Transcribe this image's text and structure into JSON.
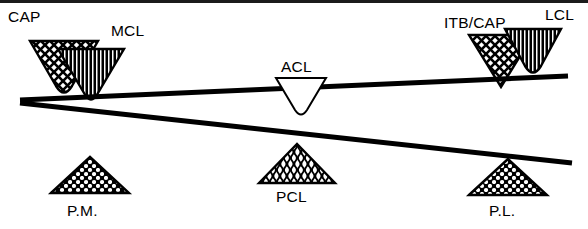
{
  "figure": {
    "background_color": "#ffffff",
    "ink_color": "#000000",
    "width": 588,
    "height": 229
  },
  "labels": {
    "cap": "CAP",
    "mcl": "MCL",
    "acl": "ACL",
    "itb_cap": "ITB/CAP",
    "lcl": "LCL",
    "pm": "P.M.",
    "pcl": "PCL",
    "pl": "P.L."
  },
  "lines": [
    {
      "name": "upper-line",
      "from_x": 20,
      "from_y": 100,
      "to_x": 568,
      "to_y": 76,
      "thickness": 5
    },
    {
      "name": "lower-line",
      "from_x": 20,
      "from_y": 103,
      "to_x": 572,
      "to_y": 163,
      "thickness": 5
    }
  ],
  "markers": [
    {
      "name": "cap",
      "label": "CAP",
      "orientation": "inverted",
      "pattern": "crosshatch",
      "fill": "#ffffff",
      "rounded_apex": true,
      "x": 30,
      "y": 41,
      "width": 68,
      "height": 58
    },
    {
      "name": "mcl",
      "label": "MCL",
      "orientation": "inverted",
      "pattern": "vertical-lines",
      "fill": "#000000",
      "rounded_apex": true,
      "x": 58,
      "y": 49,
      "width": 66,
      "height": 54
    },
    {
      "name": "acl",
      "label": "ACL",
      "orientation": "inverted",
      "pattern": "none",
      "fill": "#ffffff",
      "rounded_apex": true,
      "x": 276,
      "y": 78,
      "width": 50,
      "height": 36
    },
    {
      "name": "itb-cap",
      "label": "ITB/CAP",
      "orientation": "inverted",
      "pattern": "crosshatch",
      "fill": "#ffffff",
      "rounded_apex": false,
      "x": 469,
      "y": 35,
      "width": 64,
      "height": 52
    },
    {
      "name": "lcl",
      "label": "LCL",
      "orientation": "inverted",
      "pattern": "vertical-lines",
      "fill": "#000000",
      "rounded_apex": true,
      "x": 505,
      "y": 29,
      "width": 56,
      "height": 49
    },
    {
      "name": "pm",
      "label": "P.M.",
      "orientation": "upright",
      "pattern": "mesh-dots",
      "fill": "#ffffff",
      "rounded_apex": false,
      "x": 51,
      "y": 157,
      "width": 78,
      "height": 36
    },
    {
      "name": "pcl",
      "label": "PCL",
      "orientation": "upright",
      "pattern": "wavy-lines",
      "fill": "#ffffff",
      "rounded_apex": false,
      "x": 259,
      "y": 144,
      "width": 76,
      "height": 39
    },
    {
      "name": "pl",
      "label": "P.L.",
      "orientation": "upright",
      "pattern": "mesh-dots",
      "fill": "#ffffff",
      "rounded_apex": false,
      "x": 469,
      "y": 159,
      "width": 78,
      "height": 36
    }
  ],
  "label_positions": [
    {
      "name": "cap",
      "x": 8,
      "y": 22
    },
    {
      "name": "mcl",
      "x": 111,
      "y": 36
    },
    {
      "name": "acl",
      "x": 281,
      "y": 72
    },
    {
      "name": "itb_cap",
      "x": 444,
      "y": 28
    },
    {
      "name": "lcl",
      "x": 545,
      "y": 20
    },
    {
      "name": "pm",
      "x": 67,
      "y": 216
    },
    {
      "name": "pcl",
      "x": 276,
      "y": 202
    },
    {
      "name": "pl",
      "x": 489,
      "y": 216
    }
  ]
}
